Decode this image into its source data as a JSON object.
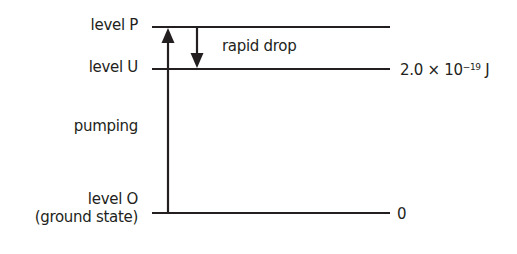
{
  "diagram": {
    "levels": [
      {
        "id": "P",
        "label": "level P",
        "y": 27,
        "energy_label": ""
      },
      {
        "id": "U",
        "label": "level U",
        "y": 69,
        "energy_label": "2.0 × 10",
        "energy_exp": "−19",
        "energy_unit": " J"
      },
      {
        "id": "O",
        "label": "level O",
        "sublabel": "(ground state)",
        "y": 213,
        "energy_label": "0"
      }
    ],
    "arrows": [
      {
        "label": "pumping",
        "from": "O",
        "to": "P",
        "direction": "up"
      },
      {
        "label": "rapid drop",
        "from": "P",
        "to": "U",
        "direction": "down"
      }
    ],
    "colors": {
      "line": "#231f20",
      "background": "#ffffff"
    }
  }
}
